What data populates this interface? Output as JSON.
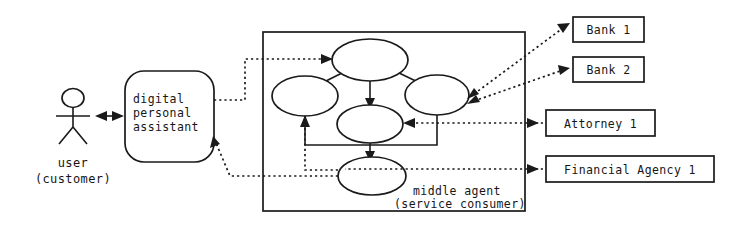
{
  "diagram": {
    "actor": {
      "name": "stick-figure-actor",
      "label_line1": "user",
      "label_line2": "(customer)"
    },
    "assistant": {
      "label_line1": "digital",
      "label_line2": "personal",
      "label_line3": "assistant"
    },
    "middle_agent": {
      "label_line1": "middle agent",
      "label_line2": "(service consumer)",
      "nodes": [
        {
          "id": "top",
          "label": ""
        },
        {
          "id": "left",
          "label": ""
        },
        {
          "id": "right",
          "label": ""
        },
        {
          "id": "center",
          "label": ""
        },
        {
          "id": "bottom",
          "label": ""
        }
      ]
    },
    "services": [
      {
        "id": "bank-1",
        "label": "Bank 1"
      },
      {
        "id": "bank-2",
        "label": "Bank 2"
      },
      {
        "id": "attorney-1",
        "label": "Attorney 1"
      },
      {
        "id": "financial-agency-1",
        "label": "Financial Agency 1"
      }
    ],
    "colors": {
      "stroke": "#1a1a1a",
      "fill": "#ffffff",
      "background": "#ffffff"
    }
  }
}
